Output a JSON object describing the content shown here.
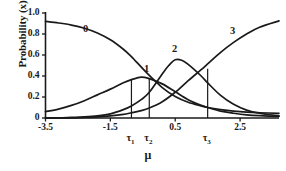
{
  "chart_data": {
    "type": "line",
    "title": "",
    "xlabel": "μ",
    "ylabel": "Probability (x)",
    "xlim": [
      -3.5,
      3.7
    ],
    "ylim": [
      0,
      1.0
    ],
    "grid": false,
    "legend_position": "inline-curve-labels",
    "xticks": [
      {
        "value": -3.5,
        "label": "-3.5"
      },
      {
        "value": -1.5,
        "label": "-1.5"
      },
      {
        "value": 0.5,
        "label": "0.5"
      },
      {
        "value": 2.5,
        "label": "2.5"
      }
    ],
    "yticks": [
      {
        "value": 0,
        "label": "0"
      },
      {
        "value": 0.2,
        "label": "0.2"
      },
      {
        "value": 0.4,
        "label": "0.4"
      },
      {
        "value": 0.6,
        "label": "0.6"
      },
      {
        "value": 0.8,
        "label": "0.8"
      },
      {
        "value": 1.0,
        "label": "1.0"
      }
    ],
    "series": [
      {
        "name": "0",
        "label": "0",
        "shape": "decreasing-sigmoid",
        "label_x": -2.25,
        "label_y": 0.835,
        "points": [
          [
            -3.5,
            0.92
          ],
          [
            -3.1,
            0.905
          ],
          [
            -2.7,
            0.885
          ],
          [
            -2.3,
            0.855
          ],
          [
            -1.9,
            0.81
          ],
          [
            -1.5,
            0.745
          ],
          [
            -1.1,
            0.655
          ],
          [
            -0.85,
            0.585
          ],
          [
            -0.7,
            0.535
          ],
          [
            -0.3,
            0.405
          ],
          [
            0.1,
            0.29
          ],
          [
            0.5,
            0.205
          ],
          [
            0.9,
            0.15
          ],
          [
            1.3,
            0.115
          ],
          [
            1.5,
            0.1
          ],
          [
            1.9,
            0.08
          ],
          [
            2.3,
            0.065
          ],
          [
            2.7,
            0.055
          ],
          [
            3.1,
            0.05
          ],
          [
            3.7,
            0.045
          ]
        ]
      },
      {
        "name": "1",
        "label": "1",
        "shape": "bell",
        "label_x": -0.37,
        "label_y": 0.455,
        "peak_x": -0.55,
        "peak_y": 0.39,
        "points": [
          [
            -3.5,
            0.06
          ],
          [
            -3.1,
            0.085
          ],
          [
            -2.7,
            0.12
          ],
          [
            -2.3,
            0.165
          ],
          [
            -1.9,
            0.22
          ],
          [
            -1.5,
            0.275
          ],
          [
            -1.1,
            0.335
          ],
          [
            -0.85,
            0.365
          ],
          [
            -0.55,
            0.39
          ],
          [
            -0.3,
            0.375
          ],
          [
            0.1,
            0.325
          ],
          [
            0.5,
            0.25
          ],
          [
            0.9,
            0.175
          ],
          [
            1.3,
            0.12
          ],
          [
            1.5,
            0.1
          ],
          [
            1.9,
            0.065
          ],
          [
            2.3,
            0.045
          ],
          [
            2.7,
            0.03
          ],
          [
            3.1,
            0.022
          ],
          [
            3.7,
            0.015
          ]
        ]
      },
      {
        "name": "2",
        "label": "2",
        "shape": "bell",
        "label_x": 0.49,
        "label_y": 0.645,
        "peak_x": 0.5,
        "peak_y": 0.555,
        "points": [
          [
            -3.5,
            0.0
          ],
          [
            -3.1,
            0.0
          ],
          [
            -2.7,
            0.005
          ],
          [
            -2.3,
            0.01
          ],
          [
            -1.9,
            0.02
          ],
          [
            -1.5,
            0.04
          ],
          [
            -1.1,
            0.08
          ],
          [
            -0.85,
            0.115
          ],
          [
            -0.55,
            0.175
          ],
          [
            -0.3,
            0.245
          ],
          [
            0.1,
            0.42
          ],
          [
            0.3,
            0.5
          ],
          [
            0.5,
            0.555
          ],
          [
            0.7,
            0.55
          ],
          [
            0.9,
            0.51
          ],
          [
            1.3,
            0.4
          ],
          [
            1.5,
            0.335
          ],
          [
            1.9,
            0.215
          ],
          [
            2.3,
            0.13
          ],
          [
            2.7,
            0.075
          ],
          [
            3.1,
            0.045
          ],
          [
            3.7,
            0.02
          ]
        ]
      },
      {
        "name": "3",
        "label": "3",
        "shape": "increasing-sigmoid",
        "label_x": 2.28,
        "label_y": 0.82,
        "points": [
          [
            -3.5,
            0.0
          ],
          [
            -3.1,
            0.0
          ],
          [
            -2.7,
            0.0
          ],
          [
            -2.3,
            0.005
          ],
          [
            -1.9,
            0.01
          ],
          [
            -1.5,
            0.02
          ],
          [
            -1.1,
            0.035
          ],
          [
            -0.85,
            0.05
          ],
          [
            -0.55,
            0.07
          ],
          [
            -0.3,
            0.095
          ],
          [
            0.1,
            0.155
          ],
          [
            0.5,
            0.245
          ],
          [
            0.9,
            0.355
          ],
          [
            1.3,
            0.46
          ],
          [
            1.5,
            0.515
          ],
          [
            1.9,
            0.625
          ],
          [
            2.3,
            0.72
          ],
          [
            2.7,
            0.8
          ],
          [
            3.1,
            0.865
          ],
          [
            3.7,
            0.925
          ]
        ]
      }
    ],
    "thresholds": [
      {
        "name": "tau1",
        "label": "τ",
        "subscript": "1",
        "x": -0.85,
        "y_top": 0.365
      },
      {
        "name": "tau2",
        "label": "τ",
        "subscript": "2",
        "x": -0.3,
        "y_top": 0.375
      },
      {
        "name": "tau3",
        "label": "τ",
        "subscript": "3",
        "x": 1.5,
        "y_top": 0.47
      }
    ],
    "colors": {
      "axis": "#1a1a1a",
      "curve": "#1a1a1a",
      "threshold": "#1a1a1a",
      "background": "#ffffff"
    }
  }
}
